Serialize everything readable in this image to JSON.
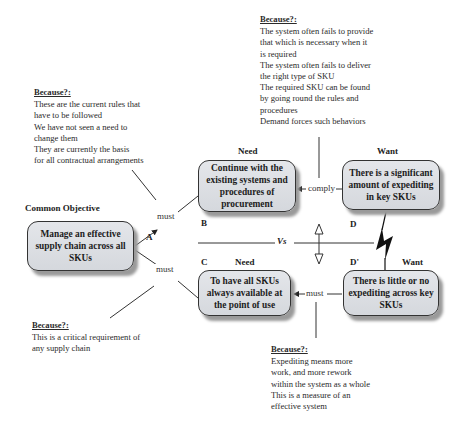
{
  "objective": {
    "heading": "Common Objective",
    "text": "Manage an effective supply chain across all SKUs",
    "letter": "A"
  },
  "need_b": {
    "heading": "Need",
    "text": "Continue with the existing systems and procedures of procurement",
    "letter": "B"
  },
  "need_c": {
    "heading": "Need",
    "text": "To have all SKUs always available at the point of use",
    "letter": "C"
  },
  "want_d": {
    "heading": "Want",
    "text": "There is a significant amount of expediting in key SKUs",
    "letter": "D"
  },
  "want_d_prime": {
    "heading": "Want",
    "text": "There is little or no expediting across key SKUs",
    "letter": "D'"
  },
  "connectors": {
    "a_to_b": "must",
    "a_to_c": "must",
    "b_to_d": "comply",
    "c_to_dprime": "must",
    "versus": "Vs"
  },
  "assumptions": {
    "ab": {
      "heading": "Because?:",
      "lines": [
        "These are the current rules that",
        "have to be followed",
        "We have not seen a need to",
        "change them",
        "They are currently the basis",
        "for all contractual arrangements"
      ]
    },
    "bd": {
      "heading": "Because?:",
      "lines": [
        "The system often fails to provide",
        "that which is necessary when it",
        "is required",
        "The system often fails to deliver",
        "the right type of SKU",
        "The required SKU can be found",
        "by going round the rules and",
        "procedures",
        "Demand forces such behaviors"
      ]
    },
    "ac": {
      "heading": "Because?:",
      "lines": [
        "This is a critical requirement of",
        "any supply chain"
      ]
    },
    "cd": {
      "heading": "Because?:",
      "lines": [
        "Expediting means more",
        "work, and more rework",
        "within the system as a whole",
        "This is a measure of an",
        "effective system"
      ]
    }
  },
  "icons": {
    "conflict": "lightning-bolt-icon",
    "tension": "double-headed-arrow-icon"
  }
}
